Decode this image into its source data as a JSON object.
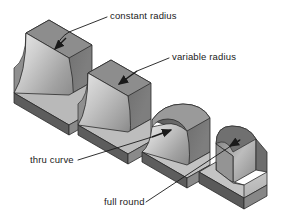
{
  "figure": {
    "background_color": "#ffffff",
    "line_color": "#1a1a1a",
    "palette": {
      "face_top_light": "#d8d8d8",
      "face_top_mid": "#bdbdbd",
      "face_front_mid": "#a8a8a8",
      "face_side_dark": "#6e6e6e",
      "face_edge_darkest": "#4a4a4a",
      "fillet_highlight": "#e6e6e6",
      "fillet_shadow": "#7a7a7a",
      "outline": "#2b2b2b"
    }
  },
  "labels": [
    {
      "id": "constant-radius",
      "text": "constant radius",
      "text_x": 110,
      "text_y": 19,
      "leader": "M107,17 L74,30 Q64,33 58,43",
      "arrow_tip": [
        54,
        50
      ],
      "arrow_from": [
        64,
        34
      ]
    },
    {
      "id": "variable-radius",
      "text": "variable radius",
      "text_x": 172,
      "text_y": 60,
      "leader": "M169,58 L136,71",
      "arrow_tip": [
        118,
        85
      ],
      "arrow_from": [
        137,
        71
      ]
    },
    {
      "id": "thru-curve",
      "text": "thru curve",
      "text_x": 30,
      "text_y": 163,
      "leader": "M78,160 L118,143",
      "arrow_tip": [
        172,
        130
      ],
      "arrow_from": [
        152,
        137
      ]
    },
    {
      "id": "full-round",
      "text": "full round",
      "text_x": 104,
      "text_y": 205,
      "leader": "M146,202 L186,184",
      "arrow_tip": [
        229,
        147
      ],
      "arrow_from": [
        240,
        140
      ]
    }
  ],
  "shapes": [
    {
      "id": "shape-constant-radius",
      "name": "L-bracket with constant radius fillet",
      "fillet_type": "constant radius",
      "origin_x": 10,
      "origin_y": 12
    },
    {
      "id": "shape-variable-radius",
      "name": "L-bracket with variable radius fillet",
      "fillet_type": "variable radius",
      "origin_x": 72,
      "origin_y": 52
    },
    {
      "id": "shape-thru-curve",
      "name": "L-bracket with thru curve fillet",
      "fillet_type": "thru curve",
      "origin_x": 130,
      "origin_y": 100
    },
    {
      "id": "shape-full-round",
      "name": "L-bracket with full round",
      "fillet_type": "full round",
      "origin_x": 190,
      "origin_y": 124
    }
  ]
}
